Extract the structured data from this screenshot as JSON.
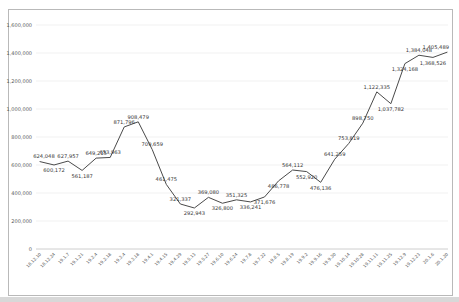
{
  "chart_data": {
    "type": "line",
    "title": "",
    "xlabel": "",
    "ylabel": "",
    "ylim": [
      0,
      1600000
    ],
    "y_tick_step": 200000,
    "y_ticks": [
      "0",
      "200,000",
      "400,000",
      "600,000",
      "800,000",
      "1,000,000",
      "1,200,000",
      "1,400,000",
      "1,600,000"
    ],
    "grid": "horizontal",
    "legend": "none",
    "line_color": "#4a4a4a",
    "label_color": "#3a3a3a",
    "axis_text_color": "#595959",
    "gridline_color": "#e7e7e7",
    "axis_line_color": "#c2c2c2",
    "frame_border_color": "#b9b9b9",
    "bottom_edge_color": "#d8d8d8",
    "x": [
      "18.12.10",
      "18.12.24",
      "19.1.7",
      "19.1.21",
      "19.2.4",
      "19.2.18",
      "19.3.4",
      "19.3.18",
      "19.4.1",
      "19.4.15",
      "19.4.29",
      "19.5.13",
      "19.5.27",
      "19.6.10",
      "19.6.24",
      "19.7.8",
      "19.7.22",
      "19.8.5",
      "19.8.19",
      "19.9.2",
      "19.9.16",
      "19.9.30",
      "19.10.14",
      "19.10.28",
      "19.11.11",
      "19.11.25",
      "19.12.9",
      "19.12.23",
      "20.1.6",
      "20.1.20"
    ],
    "series": [
      {
        "name": "values",
        "values": [
          624048,
          600172,
          627957,
          561187,
          649215,
          653963,
          871796,
          908479,
          709659,
          461475,
          321337,
          292943,
          369080,
          326800,
          351325,
          336241,
          371676,
          486778,
          564112,
          552920,
          476136,
          641259,
          753819,
          898750,
          1122335,
          1037782,
          1324168,
          1384048,
          1368526,
          1405489
        ]
      }
    ],
    "point_labels": [
      "624,048",
      "600,172",
      "627,957",
      "561,187",
      "649,215",
      "653,963",
      "871,796",
      "908,479",
      "709,659",
      "461,475",
      "321,337",
      "292,943",
      "369,080",
      "326,800",
      "351,325",
      "336,241",
      "371,676",
      "486,778",
      "564,112",
      "552,920",
      "476,136",
      "641,259",
      "753,819",
      "898,750",
      "1,122,335",
      "1,037,782",
      "1,324,168",
      "1,384,048",
      "1,368,526",
      "1,405,489"
    ],
    "label_side": [
      "above",
      "below",
      "above",
      "below",
      "above",
      "above",
      "above",
      "above",
      "above",
      "above",
      "above",
      "below",
      "above",
      "below",
      "above",
      "below",
      "below",
      "below",
      "above",
      "below",
      "below",
      "above",
      "above",
      "above",
      "above",
      "below",
      "below",
      "above",
      "below",
      "above"
    ]
  }
}
